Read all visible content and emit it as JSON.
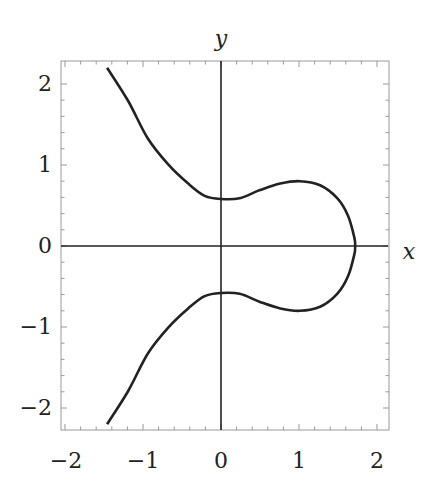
{
  "chart_data": {
    "type": "line",
    "title": "",
    "xlabel": "x",
    "ylabel": "y",
    "xlim": [
      -2.05,
      2.15
    ],
    "ylim": [
      -2.28,
      2.27
    ],
    "grid": false,
    "legend": null,
    "x_ticks": [
      -2,
      -1,
      0,
      1,
      2
    ],
    "x_tick_labels": [
      "−2",
      "−1",
      "0",
      "1",
      "2"
    ],
    "y_ticks": [
      -2,
      -1,
      0,
      1,
      2
    ],
    "y_tick_labels": [
      "−2",
      "−1",
      "0",
      "1",
      "2"
    ],
    "axes_through_origin": true,
    "frame": true,
    "series": [
      {
        "name": "upper-branch",
        "x": [
          -1.46,
          -1.19,
          -0.94,
          -0.68,
          -0.42,
          -0.21,
          0.0,
          0.24,
          0.5,
          0.76,
          1.01,
          1.27,
          1.49,
          1.63,
          1.71,
          1.72
        ],
        "y": [
          2.2,
          1.79,
          1.33,
          1.01,
          0.77,
          0.62,
          0.58,
          0.59,
          0.69,
          0.77,
          0.8,
          0.75,
          0.59,
          0.37,
          0.1,
          0.0
        ]
      },
      {
        "name": "lower-branch",
        "x": [
          -1.46,
          -1.19,
          -0.94,
          -0.68,
          -0.42,
          -0.21,
          0.0,
          0.24,
          0.5,
          0.76,
          1.01,
          1.27,
          1.49,
          1.63,
          1.71,
          1.72
        ],
        "y": [
          -2.2,
          -1.79,
          -1.33,
          -1.01,
          -0.77,
          -0.62,
          -0.58,
          -0.59,
          -0.69,
          -0.77,
          -0.8,
          -0.75,
          -0.59,
          -0.37,
          -0.1,
          0.0
        ]
      }
    ],
    "curve_color": "#222222",
    "axis_color": "#222222",
    "frame_color": "#999999"
  }
}
